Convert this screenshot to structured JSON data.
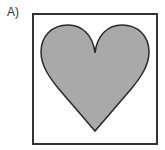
{
  "option": {
    "label": "A)"
  },
  "figure": {
    "shape": "heart",
    "fill_color": "#a9a9a9",
    "stroke_color": "#2a2a2a",
    "frame_color": "#333333",
    "frame_fill": "#ffffff"
  }
}
